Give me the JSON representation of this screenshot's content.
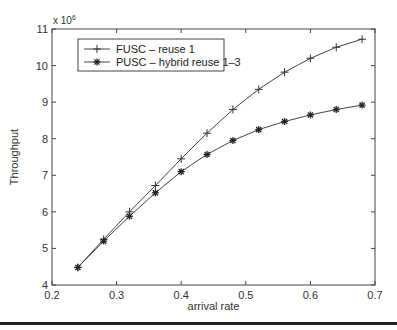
{
  "chart_data": {
    "type": "line",
    "title": "",
    "xlabel": "arrival rate",
    "ylabel": "Throughput",
    "y_multiplier": "x 10^6",
    "xlim": [
      0.2,
      0.7
    ],
    "ylim": [
      4,
      11
    ],
    "xticks": [
      "0.2",
      "0.3",
      "0.4",
      "0.5",
      "0.6",
      "0.7"
    ],
    "yticks": [
      "4",
      "5",
      "6",
      "7",
      "8",
      "9",
      "10",
      "11"
    ],
    "grid": false,
    "legend_position": "upper left",
    "x": [
      0.24,
      0.28,
      0.32,
      0.36,
      0.4,
      0.44,
      0.48,
      0.52,
      0.56,
      0.6,
      0.64,
      0.68
    ],
    "series": [
      {
        "name": "FUSC – reuse 1",
        "marker": "+",
        "values": [
          4.48,
          5.25,
          6.0,
          6.72,
          7.45,
          8.15,
          8.8,
          9.35,
          9.82,
          10.2,
          10.5,
          10.72
        ]
      },
      {
        "name": "PUSC – hybrid reuse 1–3",
        "marker": "*",
        "values": [
          4.48,
          5.2,
          5.88,
          6.52,
          7.1,
          7.57,
          7.95,
          8.25,
          8.47,
          8.65,
          8.8,
          8.92
        ]
      }
    ]
  },
  "labels": {
    "multiplier_base": "x 10",
    "multiplier_exp": "6"
  }
}
